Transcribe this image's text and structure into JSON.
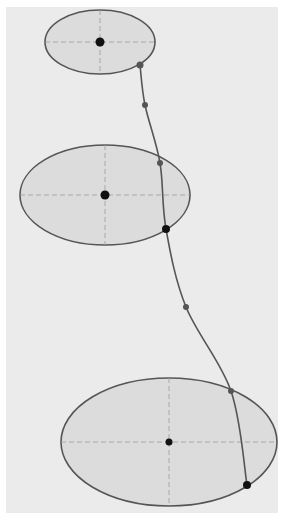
{
  "diagram": {
    "type": "ellipse-trajectory",
    "background": {
      "x": 6,
      "y": 7,
      "width": 272,
      "height": 506,
      "color": "#ebebeb"
    },
    "colors": {
      "ellipse_fill": "#dcdcdc",
      "ellipse_stroke": "#555555",
      "axis_dash": "#9a9a9a",
      "curve": "#555555",
      "center_dot": "#111111",
      "small_dot": "#555555",
      "large_dot": "#111111"
    },
    "ellipses": [
      {
        "id": "top",
        "cx": 100,
        "cy": 42,
        "rx": 55,
        "ry": 32
      },
      {
        "id": "middle",
        "cx": 105,
        "cy": 195,
        "rx": 85,
        "ry": 50
      },
      {
        "id": "bottom",
        "cx": 169,
        "cy": 442,
        "rx": 108,
        "ry": 64
      }
    ],
    "curve_points": [
      [
        140,
        65
      ],
      [
        145,
        105
      ],
      [
        160,
        163
      ],
      [
        166,
        229
      ],
      [
        186,
        307
      ],
      [
        231,
        391
      ],
      [
        247,
        485
      ]
    ],
    "dots": [
      {
        "x": 140,
        "y": 65,
        "r": 3.5,
        "kind": "small"
      },
      {
        "x": 145,
        "y": 105,
        "r": 3,
        "kind": "small"
      },
      {
        "x": 160,
        "y": 163,
        "r": 3,
        "kind": "small"
      },
      {
        "x": 166,
        "y": 229,
        "r": 4,
        "kind": "large"
      },
      {
        "x": 186,
        "y": 307,
        "r": 3,
        "kind": "small"
      },
      {
        "x": 231,
        "y": 391,
        "r": 3,
        "kind": "small"
      },
      {
        "x": 247,
        "y": 485,
        "r": 4,
        "kind": "large"
      }
    ]
  }
}
